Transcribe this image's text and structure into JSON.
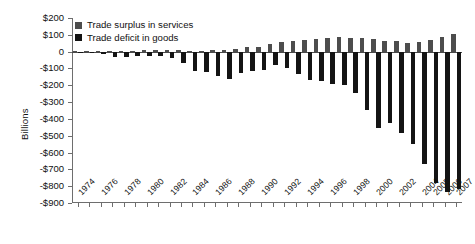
{
  "chart_data": {
    "type": "bar",
    "title": "",
    "xlabel": "",
    "ylabel": "Billions",
    "ylim": [
      -900,
      200
    ],
    "ytick_step": 100,
    "grid": false,
    "legend_position": "top-left",
    "ytick_labels": [
      "$200",
      "$100",
      "0",
      "-$100",
      "-$200",
      "-$300",
      "-$400",
      "-$500",
      "-$600",
      "-$700",
      "-$800",
      "-$900"
    ],
    "ytick_values": [
      200,
      100,
      0,
      -100,
      -200,
      -300,
      -400,
      -500,
      -600,
      -700,
      -800,
      -900
    ],
    "categories": [
      "1974",
      "1975",
      "1976",
      "1977",
      "1978",
      "1979",
      "1980",
      "1981",
      "1982",
      "1983",
      "1984",
      "1985",
      "1986",
      "1987",
      "1988",
      "1989",
      "1990",
      "1991",
      "1992",
      "1993",
      "1994",
      "1995",
      "1996",
      "1997",
      "1998",
      "1999",
      "2000",
      "2001",
      "2002",
      "2003",
      "2004",
      "2005",
      "2006",
      "2007"
    ],
    "xtick_labels": [
      "1974",
      "",
      "1976",
      "",
      "1978",
      "",
      "1980",
      "",
      "1982",
      "",
      "1984",
      "",
      "1986",
      "",
      "1988",
      "",
      "1990",
      "",
      "1992",
      "",
      "1994",
      "",
      "1996",
      "",
      "1998",
      "",
      "2000",
      "",
      "2002",
      "",
      "2004",
      "2005",
      "2006",
      "2007"
    ],
    "series": [
      {
        "name": "Trade surplus in services",
        "color": "#4d4d4d",
        "values": [
          3,
          5,
          4,
          3,
          4,
          6,
          7,
          10,
          9,
          8,
          4,
          6,
          10,
          12,
          18,
          26,
          30,
          43,
          56,
          62,
          67,
          74,
          81,
          88,
          80,
          82,
          75,
          65,
          61,
          54,
          60,
          72,
          85,
          105
        ]
      },
      {
        "name": "Trade deficit in goods",
        "color": "#141414",
        "values": [
          -5,
          -9,
          -16,
          -31,
          -34,
          -28,
          -26,
          -28,
          -37,
          -67,
          -113,
          -122,
          -145,
          -160,
          -127,
          -116,
          -111,
          -77,
          -97,
          -133,
          -166,
          -174,
          -191,
          -198,
          -248,
          -346,
          -452,
          -427,
          -482,
          -547,
          -666,
          -783,
          -836,
          -819
        ]
      }
    ],
    "legend": [
      "Trade surplus in services",
      "Trade deficit in goods"
    ]
  }
}
